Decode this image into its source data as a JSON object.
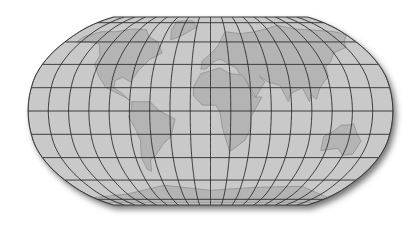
{
  "map": {
    "projection": "Robinson",
    "graticule_step_degrees": 20,
    "center_x": 210.5,
    "center_y": 111,
    "scale": 110.8,
    "half_width": 182.5,
    "colors": {
      "background": "#ffffff",
      "land_sea_fill": "#c9c9c9",
      "relief_fill": "#b4b4b4",
      "coastline": "#8a8a8a",
      "graticule": "#2e2e2e",
      "outline": "#3a3a3a",
      "shadow": "#6f6f6f"
    },
    "meridians": [
      -180,
      -160,
      -140,
      -120,
      -100,
      -80,
      -60,
      -40,
      -20,
      0,
      20,
      40,
      60,
      80,
      100,
      120,
      140,
      160,
      180
    ],
    "parallels": [
      -80,
      -60,
      -40,
      -20,
      0,
      20,
      40,
      60,
      80
    ],
    "landmasses": [
      {
        "name": "north-america",
        "points": [
          [
            -165,
            65
          ],
          [
            -150,
            70
          ],
          [
            -130,
            70
          ],
          [
            -110,
            73
          ],
          [
            -90,
            72
          ],
          [
            -80,
            65
          ],
          [
            -65,
            60
          ],
          [
            -55,
            50
          ],
          [
            -67,
            44
          ],
          [
            -75,
            35
          ],
          [
            -81,
            25
          ],
          [
            -90,
            29
          ],
          [
            -97,
            26
          ],
          [
            -97,
            20
          ],
          [
            -88,
            15
          ],
          [
            -80,
            9
          ],
          [
            -85,
            12
          ],
          [
            -105,
            20
          ],
          [
            -115,
            30
          ],
          [
            -124,
            40
          ],
          [
            -124,
            48
          ],
          [
            -135,
            58
          ],
          [
            -150,
            60
          ],
          [
            -165,
            60
          ]
        ]
      },
      {
        "name": "greenland",
        "points": [
          [
            -55,
            82
          ],
          [
            -30,
            83
          ],
          [
            -20,
            75
          ],
          [
            -40,
            65
          ],
          [
            -50,
            62
          ],
          [
            -55,
            72
          ]
        ]
      },
      {
        "name": "south-america",
        "points": [
          [
            -78,
            8
          ],
          [
            -60,
            8
          ],
          [
            -50,
            0
          ],
          [
            -35,
            -7
          ],
          [
            -40,
            -22
          ],
          [
            -48,
            -28
          ],
          [
            -58,
            -38
          ],
          [
            -65,
            -42
          ],
          [
            -68,
            -52
          ],
          [
            -72,
            -50
          ],
          [
            -74,
            -40
          ],
          [
            -71,
            -25
          ],
          [
            -75,
            -15
          ],
          [
            -81,
            -5
          ],
          [
            -78,
            2
          ]
        ]
      },
      {
        "name": "europe-asia",
        "points": [
          [
            -10,
            36
          ],
          [
            -9,
            43
          ],
          [
            -2,
            48
          ],
          [
            5,
            53
          ],
          [
            10,
            58
          ],
          [
            20,
            70
          ],
          [
            40,
            68
          ],
          [
            60,
            70
          ],
          [
            80,
            73
          ],
          [
            100,
            77
          ],
          [
            120,
            73
          ],
          [
            140,
            72
          ],
          [
            170,
            70
          ],
          [
            180,
            67
          ],
          [
            165,
            60
          ],
          [
            160,
            55
          ],
          [
            140,
            50
          ],
          [
            130,
            42
          ],
          [
            122,
            38
          ],
          [
            121,
            30
          ],
          [
            110,
            20
          ],
          [
            105,
            10
          ],
          [
            100,
            14
          ],
          [
            98,
            8
          ],
          [
            92,
            20
          ],
          [
            80,
            15
          ],
          [
            77,
            8
          ],
          [
            70,
            22
          ],
          [
            58,
            25
          ],
          [
            50,
            30
          ],
          [
            55,
            25
          ],
          [
            45,
            12
          ],
          [
            35,
            28
          ],
          [
            30,
            32
          ],
          [
            27,
            37
          ],
          [
            20,
            40
          ],
          [
            12,
            44
          ],
          [
            8,
            44
          ],
          [
            3,
            42
          ],
          [
            -5,
            36
          ]
        ]
      },
      {
        "name": "africa",
        "points": [
          [
            -17,
            21
          ],
          [
            -10,
            32
          ],
          [
            10,
            37
          ],
          [
            20,
            32
          ],
          [
            32,
            31
          ],
          [
            35,
            28
          ],
          [
            43,
            12
          ],
          [
            51,
            12
          ],
          [
            40,
            -5
          ],
          [
            40,
            -15
          ],
          [
            35,
            -25
          ],
          [
            20,
            -35
          ],
          [
            17,
            -28
          ],
          [
            12,
            -15
          ],
          [
            9,
            0
          ],
          [
            5,
            5
          ],
          [
            -8,
            5
          ],
          [
            -17,
            13
          ]
        ]
      },
      {
        "name": "australia",
        "points": [
          [
            114,
            -22
          ],
          [
            122,
            -18
          ],
          [
            130,
            -12
          ],
          [
            137,
            -12
          ],
          [
            142,
            -11
          ],
          [
            146,
            -18
          ],
          [
            153,
            -26
          ],
          [
            150,
            -37
          ],
          [
            140,
            -38
          ],
          [
            132,
            -32
          ],
          [
            115,
            -34
          ]
        ]
      },
      {
        "name": "antarctica",
        "points": [
          [
            -180,
            -78
          ],
          [
            -120,
            -74
          ],
          [
            -60,
            -65
          ],
          [
            0,
            -70
          ],
          [
            60,
            -67
          ],
          [
            120,
            -66
          ],
          [
            180,
            -78
          ],
          [
            180,
            -85
          ],
          [
            -180,
            -85
          ]
        ]
      }
    ]
  }
}
